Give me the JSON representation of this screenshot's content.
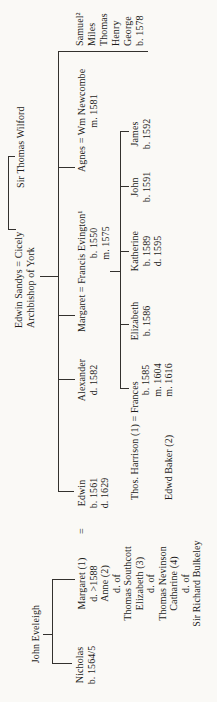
{
  "tree": {
    "gen1": {
      "john_eveleigh": "John Eveleigh",
      "sandys_cicely": "Edwin Sandys = Cicely",
      "archbishop": "Archbishop of York",
      "wilford": "Sir Thomas Wilford"
    },
    "gen2": {
      "nicholas": [
        "Nicholas",
        "b. 1564/5"
      ],
      "margaret_wives": [
        "Margaret (1)",
        "d. >1588",
        "Anne (2)",
        "d. of",
        "Thomas Southcott",
        "Elizabeth (3)",
        "d. of",
        "Thomas Nevinson",
        "Catharine (4)",
        "d. of",
        "Sir Richard Bulkeley"
      ],
      "equals": "=",
      "edwin": [
        "Edwin",
        "b. 1561",
        "d. 1629"
      ],
      "alexander": [
        "Alexander",
        "d. 1582"
      ],
      "margaret_evington": "Margaret = Francis Evington¹",
      "evington_dates": [
        "b. 1550",
        "m. 1575"
      ],
      "agnes_newcombe": "Agnes = Wm Newcombe",
      "agnes_dates": [
        "m. 1581"
      ],
      "younger_children": [
        "Samuel²",
        "Miles",
        "Thomas",
        "Henry",
        "George",
        "b. 1578"
      ]
    },
    "gen3": {
      "harrison_frances": "Thos. Harrison (1) = Frances",
      "frances_dates": [
        "b. 1585",
        "m. 1604"
      ],
      "baker": "Edwd Baker (2)",
      "baker_date": "m. 1616",
      "elizabeth": [
        "Elizabeth",
        "b. 1586"
      ],
      "katherine": [
        "Katherine",
        "b. 1589",
        "d. 1595"
      ],
      "john": [
        "John",
        "b. 1591"
      ],
      "james": [
        "James",
        "b. 1592"
      ]
    }
  }
}
